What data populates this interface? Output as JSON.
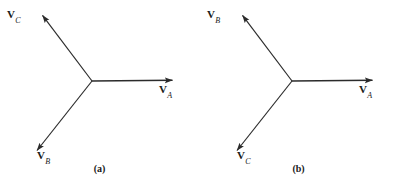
{
  "figure": {
    "background_color": "#ffffff",
    "line_color": "#2b2b2b",
    "panels": [
      {
        "id": "a",
        "caption": "(a)",
        "origin": {
          "x": 92,
          "y": 81
        },
        "vectors": [
          {
            "name": "V_A",
            "symbol": "V",
            "subscript": "A",
            "tip": {
              "x": 178,
              "y": 80
            },
            "label_pos": {
              "x": 160,
              "y": 84
            },
            "angle_deg": 0
          },
          {
            "name": "V_C",
            "symbol": "V",
            "subscript": "C",
            "tip": {
              "x": 38,
              "y": 11
            },
            "label_pos": {
              "x": 8,
              "y": 12
            },
            "angle_deg": 120
          },
          {
            "name": "V_B",
            "symbol": "V",
            "subscript": "B",
            "tip": {
              "x": 32,
              "y": 155
            },
            "label_pos": {
              "x": 36,
              "y": 152
            },
            "angle_deg": 240
          }
        ]
      },
      {
        "id": "b",
        "caption": "(b)",
        "origin": {
          "x": 93,
          "y": 81
        },
        "vectors": [
          {
            "name": "V_A",
            "symbol": "V",
            "subscript": "A",
            "tip": {
              "x": 179,
              "y": 80
            },
            "label_pos": {
              "x": 161,
              "y": 84
            },
            "angle_deg": 0
          },
          {
            "name": "V_B",
            "symbol": "V",
            "subscript": "B",
            "tip": {
              "x": 39,
              "y": 11
            },
            "label_pos": {
              "x": 9,
              "y": 12
            },
            "angle_deg": 120
          },
          {
            "name": "V_C",
            "symbol": "V",
            "subscript": "C",
            "tip": {
              "x": 33,
              "y": 155
            },
            "label_pos": {
              "x": 37,
              "y": 152
            },
            "angle_deg": 240
          }
        ]
      }
    ]
  },
  "panel_a": {
    "caption": "(a)",
    "v_a": {
      "symbol": "V",
      "sub": "A"
    },
    "v_b": {
      "symbol": "V",
      "sub": "B"
    },
    "v_c": {
      "symbol": "V",
      "sub": "C"
    }
  },
  "panel_b": {
    "caption": "(b)",
    "v_a": {
      "symbol": "V",
      "sub": "A"
    },
    "v_b": {
      "symbol": "V",
      "sub": "B"
    },
    "v_c": {
      "symbol": "V",
      "sub": "C"
    }
  }
}
